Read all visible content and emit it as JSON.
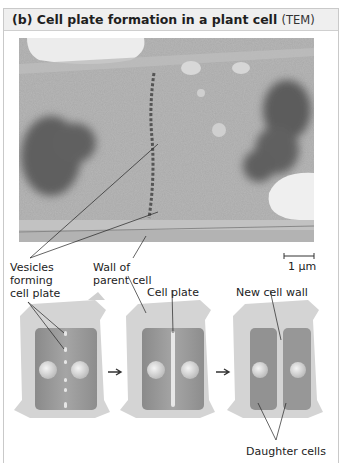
{
  "figure": {
    "title": "(b) Cell plate formation in a plant cell",
    "title_suffix": "(TEM)",
    "header_bg": "#efefef",
    "border_color": "#c9c9c9"
  },
  "micrograph": {
    "type": "TEM",
    "scale_bar_label": "1 µm"
  },
  "labels": {
    "vesicles": [
      "Vesicles",
      "forming",
      "cell plate"
    ],
    "wall_parent": [
      "Wall of",
      "parent cell"
    ],
    "cell_plate": "Cell plate",
    "new_cell_wall": "New cell wall",
    "daughter_cells": "Daughter cells"
  },
  "diagram": {
    "stages": [
      {
        "name": "vesicles-stage"
      },
      {
        "name": "cell-plate-stage"
      },
      {
        "name": "daughter-cells-stage"
      }
    ],
    "arrow_icon": "right-arrow-icon"
  }
}
